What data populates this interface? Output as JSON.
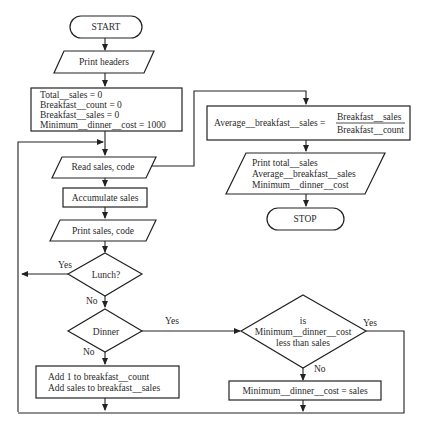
{
  "diagram": {
    "type": "flowchart",
    "nodes": {
      "start": "START",
      "print_headers": "Print headers",
      "init": [
        "Total__sales = 0",
        "Breakfast__count = 0",
        "Breakfast__sales = 0",
        "Minimum__dinner__cost = 1000"
      ],
      "read": "Read sales, code",
      "accumulate": "Accumulate sales",
      "print_sales": "Print sales, code",
      "lunch": "Lunch?",
      "dinner": "Dinner",
      "add_breakfast": [
        "Add 1 to breakfast__count",
        "Add sales to breakfast__sales"
      ],
      "average": {
        "lhs": "Average__breakfast__sales =",
        "numerator": "Breakfast__sales",
        "denominator": "Breakfast__count"
      },
      "print_results": [
        "Print total__sales",
        "Average__breakfast__sales",
        "Minimum__dinner__cost"
      ],
      "stop": "STOP",
      "min_check": [
        "is",
        "Minimum__dinner__cost",
        "less than sales"
      ],
      "min_assign": "Minimum__dinner__cost = sales"
    },
    "edge_labels": {
      "lunch_yes": "Yes",
      "lunch_no": "No",
      "dinner_yes": "Yes",
      "dinner_no": "No",
      "min_yes": "Yes",
      "min_no": "No"
    }
  }
}
